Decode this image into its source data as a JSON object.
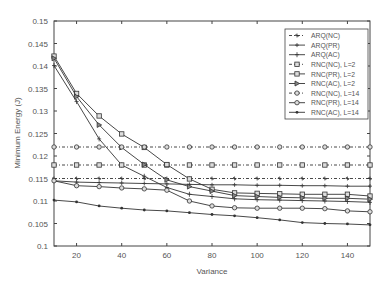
{
  "chart_data": {
    "type": "line",
    "title": "",
    "xlabel": "Variance",
    "ylabel": "Minimum Energy (J)",
    "xlim": [
      10,
      150
    ],
    "ylim": [
      0.1,
      0.15
    ],
    "grid": false,
    "legend_position": "upper right",
    "x_ticks": [
      20,
      40,
      60,
      80,
      100,
      120,
      140
    ],
    "y_ticks": [
      0.1,
      0.105,
      0.11,
      0.115,
      0.12,
      0.125,
      0.13,
      0.135,
      0.14,
      0.145,
      0.15
    ],
    "x": [
      10,
      20,
      30,
      40,
      50,
      60,
      70,
      80,
      90,
      100,
      110,
      120,
      130,
      140,
      150
    ],
    "series": [
      {
        "name": "ARQ(NC)",
        "style": "dashed",
        "marker": "star",
        "values": [
          0.115,
          0.115,
          0.115,
          0.115,
          0.115,
          0.115,
          0.115,
          0.115,
          0.115,
          0.115,
          0.115,
          0.115,
          0.115,
          0.115,
          0.115
        ]
      },
      {
        "name": "ARQ(PR)",
        "style": "solid",
        "marker": "plus",
        "values": [
          0.1145,
          0.1142,
          0.1141,
          0.114,
          0.1139,
          0.1138,
          0.1137,
          0.1136,
          0.1136,
          0.1135,
          0.1135,
          0.1134,
          0.1134,
          0.1133,
          0.1133
        ]
      },
      {
        "name": "ARQ(AC)",
        "style": "solid",
        "marker": "cross",
        "values": [
          0.1401,
          0.1321,
          0.1238,
          0.118,
          0.1155,
          0.113,
          0.1115,
          0.111,
          0.1105,
          0.1103,
          0.1102,
          0.1101,
          0.11,
          0.1099,
          0.1097
        ]
      },
      {
        "name": "RNC(NC), L=2",
        "style": "dashed",
        "marker": "square",
        "values": [
          0.118,
          0.118,
          0.118,
          0.118,
          0.118,
          0.118,
          0.118,
          0.118,
          0.118,
          0.118,
          0.118,
          0.118,
          0.118,
          0.118,
          0.118
        ]
      },
      {
        "name": "RNC(PR), L=2",
        "style": "solid",
        "marker": "square",
        "values": [
          0.1422,
          0.1339,
          0.1289,
          0.1249,
          0.1219,
          0.1181,
          0.1149,
          0.1126,
          0.1118,
          0.1117,
          0.1116,
          0.1115,
          0.1115,
          0.1115,
          0.1111
        ]
      },
      {
        "name": "RNC(AC), L=2",
        "style": "solid",
        "marker": "triangle",
        "values": [
          0.1417,
          0.1332,
          0.1269,
          0.1219,
          0.1181,
          0.1147,
          0.1132,
          0.1122,
          0.1112,
          0.111,
          0.1108,
          0.1107,
          0.1106,
          0.1106,
          0.1104
        ]
      },
      {
        "name": "RNC(NC), L=14",
        "style": "dashed",
        "marker": "circle",
        "values": [
          0.122,
          0.122,
          0.122,
          0.122,
          0.122,
          0.122,
          0.122,
          0.122,
          0.122,
          0.122,
          0.122,
          0.122,
          0.122,
          0.122,
          0.122
        ]
      },
      {
        "name": "RNC(PR), L=14",
        "style": "solid",
        "marker": "circle",
        "values": [
          0.1145,
          0.1134,
          0.1132,
          0.1129,
          0.1127,
          0.1124,
          0.11,
          0.1089,
          0.1085,
          0.1084,
          0.1084,
          0.1084,
          0.1083,
          0.1078,
          0.1076
        ]
      },
      {
        "name": "RNC(AC), L=14",
        "style": "solid",
        "marker": "dot",
        "values": [
          0.1102,
          0.1098,
          0.1089,
          0.1084,
          0.108,
          0.1078,
          0.1074,
          0.107,
          0.1067,
          0.1063,
          0.1058,
          0.1052,
          0.105,
          0.1049,
          0.1047
        ]
      }
    ]
  },
  "legend": {
    "items": [
      "ARQ(NC)",
      "ARQ(PR)",
      "ARQ(AC)",
      "RNC(NC), L=2",
      "RNC(PR), L=2",
      "RNC(AC), L=2",
      "RNC(NC), L=14",
      "RNC(PR), L=14",
      "RNC(AC), L=14"
    ]
  },
  "axes": {
    "xlabel": "Variance",
    "ylabel": "Minimum Energy (J)",
    "x_tick_labels": [
      "20",
      "40",
      "60",
      "80",
      "100",
      "120",
      "140"
    ],
    "y_tick_labels": [
      "0.1",
      "0.105",
      "0.11",
      "0.115",
      "0.12",
      "0.125",
      "0.13",
      "0.135",
      "0.14",
      "0.145",
      "0.15"
    ]
  },
  "colors": {
    "line": "#333333",
    "axis": "#444444",
    "text": "#555555",
    "background": "#ffffff"
  }
}
